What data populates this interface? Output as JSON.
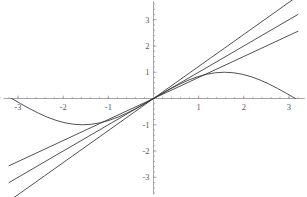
{
  "chart_data": {
    "type": "line",
    "title": "",
    "subtitle": "",
    "xlabel": "",
    "ylabel": "",
    "xlim": [
      -3.4,
      3.4
    ],
    "ylim": [
      -3.75,
      3.75
    ],
    "grid": false,
    "legend": "none",
    "background": "#ffffff",
    "axis_color": "#8f8f8f",
    "curve_color": "#333333",
    "xticks": [
      -3,
      -2,
      -1,
      1,
      2,
      3
    ],
    "xtick_labels": [
      "-3",
      "-2",
      "-1",
      "1",
      "2",
      "3"
    ],
    "yticks": [
      3,
      2,
      1,
      -1,
      -2,
      -3
    ],
    "ytick_labels": [
      "3",
      "2",
      "1",
      "-1",
      "-2",
      "-3"
    ],
    "minor_tick_step": 0.2,
    "series": [
      {
        "name": "sin(x)",
        "type": "curve",
        "expression": "sin(x)",
        "x_start": -3.14159,
        "x_end": 3.14159,
        "color": "#333333",
        "x": [
          -3.1416,
          -2.9452,
          -2.7489,
          -2.5525,
          -2.3562,
          -2.1598,
          -1.9635,
          -1.7671,
          -1.5708,
          -1.3744,
          -1.1781,
          -0.9817,
          -0.7854,
          -0.589,
          -0.3927,
          -0.1963,
          0,
          0.1963,
          0.3927,
          0.589,
          0.7854,
          0.9817,
          1.1781,
          1.3744,
          1.5708,
          1.7671,
          1.9635,
          2.1598,
          2.3562,
          2.5525,
          2.7489,
          2.9452,
          3.1416
        ],
        "y": [
          0,
          -0.1951,
          -0.3827,
          -0.5556,
          -0.7071,
          -0.8315,
          -0.9239,
          -0.9808,
          -1,
          -0.9808,
          -0.9239,
          -0.8315,
          -0.7071,
          -0.5556,
          -0.3827,
          -0.1951,
          0,
          0.1951,
          0.3827,
          0.5556,
          0.7071,
          0.8315,
          0.9239,
          0.9808,
          1,
          0.9808,
          0.9239,
          0.8315,
          0.7071,
          0.5556,
          0.3827,
          0.1951,
          0
        ]
      },
      {
        "name": "slope-0.80 line",
        "type": "line",
        "expression": "0.80 x",
        "slope": 0.8,
        "intercept": 0,
        "x_start": -3.2,
        "x_end": 3.2,
        "y_start": -2.56,
        "y_end": 2.56,
        "color": "#333333"
      },
      {
        "name": "slope-1.00 line",
        "type": "line",
        "expression": "1.00 x",
        "slope": 1.0,
        "intercept": 0,
        "x_start": -3.2,
        "x_end": 3.2,
        "y_start": -3.2,
        "y_end": 3.2,
        "color": "#333333"
      },
      {
        "name": "slope-1.22 line",
        "type": "line",
        "expression": "1.22 x",
        "slope": 1.22,
        "intercept": 0,
        "x_start": -3.2,
        "x_end": 3.2,
        "y_start": -3.904,
        "y_end": 3.904,
        "color": "#333333"
      }
    ],
    "annotations": []
  }
}
